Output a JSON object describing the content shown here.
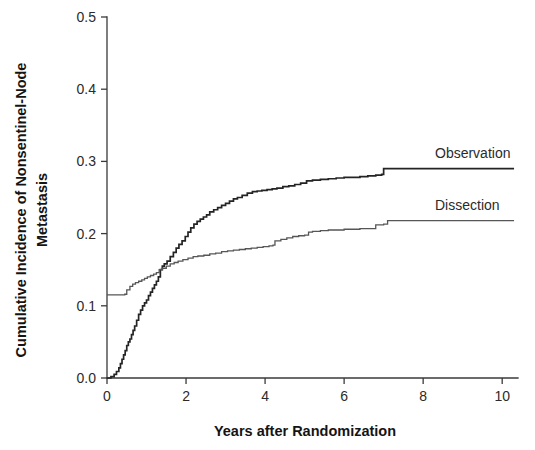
{
  "chart_data": {
    "type": "line",
    "title": "",
    "xlabel": "Years after Randomization",
    "ylabel": "Cumulative Incidence of Nonsentinel-Node Metastasis",
    "ylabel_line1": "Cumulative Incidence of Nonsentinel-Node",
    "ylabel_line2": "Metastasis",
    "xlim": [
      0,
      10.4
    ],
    "ylim": [
      0.0,
      0.5
    ],
    "xticks": [
      0,
      2,
      4,
      6,
      8,
      10
    ],
    "xticklabels": [
      "0",
      "2",
      "4",
      "6",
      "8",
      "10"
    ],
    "yticks": [
      0.0,
      0.1,
      0.2,
      0.3,
      0.4,
      0.5
    ],
    "yticklabels": [
      "0.0",
      "0.1",
      "0.2",
      "0.3",
      "0.4",
      "0.5"
    ],
    "grid": false,
    "legend_position": "inline-right",
    "step_style": "post",
    "series": [
      {
        "name": "Observation",
        "label": "Observation",
        "color": "#242424",
        "final_value": 0.29,
        "x": [
          0.0,
          0.1,
          0.18,
          0.24,
          0.3,
          0.34,
          0.38,
          0.42,
          0.46,
          0.5,
          0.54,
          0.58,
          0.62,
          0.66,
          0.7,
          0.75,
          0.8,
          0.85,
          0.9,
          0.95,
          1.0,
          1.05,
          1.1,
          1.15,
          1.2,
          1.25,
          1.3,
          1.35,
          1.4,
          1.45,
          1.52,
          1.6,
          1.68,
          1.75,
          1.82,
          1.9,
          1.98,
          2.05,
          2.12,
          2.2,
          2.28,
          2.36,
          2.44,
          2.52,
          2.6,
          2.7,
          2.8,
          2.9,
          3.0,
          3.1,
          3.2,
          3.3,
          3.42,
          3.55,
          3.68,
          3.8,
          3.92,
          4.05,
          4.18,
          4.3,
          4.45,
          4.6,
          4.75,
          4.9,
          5.05,
          5.2,
          5.4,
          5.6,
          5.8,
          6.0,
          6.2,
          6.4,
          6.6,
          6.8,
          6.95,
          7.0,
          7.4,
          8.0,
          9.0,
          10.3
        ],
        "y": [
          0.0,
          0.002,
          0.005,
          0.009,
          0.014,
          0.02,
          0.026,
          0.032,
          0.038,
          0.045,
          0.05,
          0.054,
          0.06,
          0.066,
          0.072,
          0.08,
          0.088,
          0.094,
          0.1,
          0.104,
          0.108,
          0.114,
          0.119,
          0.124,
          0.129,
          0.134,
          0.14,
          0.15,
          0.155,
          0.158,
          0.162,
          0.168,
          0.174,
          0.18,
          0.185,
          0.19,
          0.196,
          0.202,
          0.208,
          0.213,
          0.217,
          0.22,
          0.223,
          0.226,
          0.23,
          0.233,
          0.236,
          0.239,
          0.242,
          0.245,
          0.248,
          0.25,
          0.253,
          0.256,
          0.258,
          0.259,
          0.26,
          0.261,
          0.262,
          0.263,
          0.265,
          0.266,
          0.268,
          0.27,
          0.273,
          0.274,
          0.275,
          0.276,
          0.277,
          0.278,
          0.278,
          0.279,
          0.28,
          0.281,
          0.282,
          0.29,
          0.29,
          0.29,
          0.29,
          0.29
        ]
      },
      {
        "name": "Dissection",
        "label": "Dissection",
        "color": "#565656",
        "initial_value": 0.115,
        "final_value": 0.218,
        "x": [
          0.0,
          0.3,
          0.45,
          0.5,
          0.58,
          0.65,
          0.72,
          0.8,
          0.88,
          0.95,
          1.02,
          1.1,
          1.18,
          1.25,
          1.32,
          1.4,
          1.5,
          1.6,
          1.7,
          1.8,
          1.92,
          2.05,
          2.18,
          2.3,
          2.45,
          2.6,
          2.75,
          2.9,
          3.05,
          3.2,
          3.35,
          3.5,
          3.65,
          3.8,
          3.95,
          4.1,
          4.2,
          4.25,
          4.4,
          4.55,
          4.7,
          4.85,
          5.0,
          5.1,
          5.2,
          5.4,
          5.6,
          5.8,
          6.0,
          6.2,
          6.4,
          6.6,
          6.75,
          6.8,
          7.0,
          7.1,
          7.5,
          8.0,
          9.0,
          10.3
        ],
        "y": [
          0.115,
          0.115,
          0.116,
          0.122,
          0.127,
          0.13,
          0.132,
          0.134,
          0.136,
          0.138,
          0.14,
          0.142,
          0.144,
          0.146,
          0.15,
          0.152,
          0.155,
          0.158,
          0.16,
          0.162,
          0.164,
          0.166,
          0.168,
          0.169,
          0.17,
          0.172,
          0.173,
          0.175,
          0.176,
          0.177,
          0.178,
          0.179,
          0.18,
          0.181,
          0.182,
          0.183,
          0.184,
          0.19,
          0.192,
          0.194,
          0.196,
          0.197,
          0.198,
          0.202,
          0.203,
          0.204,
          0.205,
          0.205,
          0.206,
          0.206,
          0.207,
          0.207,
          0.207,
          0.212,
          0.213,
          0.218,
          0.218,
          0.218,
          0.218,
          0.218
        ]
      }
    ],
    "annotations": [
      {
        "text": "Observation",
        "x": 8.3,
        "y": 0.305
      },
      {
        "text": "Dissection",
        "x": 8.3,
        "y": 0.233
      }
    ]
  },
  "geometry": {
    "plot_left": 107,
    "plot_right": 518,
    "plot_top": 17,
    "plot_bottom": 378
  }
}
